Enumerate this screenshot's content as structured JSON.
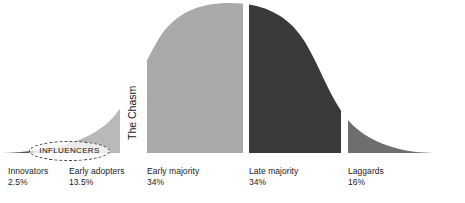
{
  "figure": {
    "type": "diffusion-of-innovation-bell-curve",
    "background_color": "#ffffff",
    "chasm_label": "The Chasm",
    "callout": {
      "label": "INFLUENCERS",
      "shape": "dashed-ellipse",
      "border_color": "#3a3a3a"
    }
  },
  "segments": [
    {
      "key": "innovators",
      "label": "Innovators",
      "percent": "2.5%",
      "color": "#58585a",
      "x_start": 2,
      "x_end": 34
    },
    {
      "key": "early_adopters",
      "label": "Early adopters",
      "percent": "13.5%",
      "color": "#b9b9b9",
      "x_start": 34,
      "x_end": 120
    },
    {
      "key": "early_majority",
      "label": "Early majority",
      "percent": "34%",
      "color": "#a9a9a9",
      "x_start": 147,
      "x_end": 243
    },
    {
      "key": "late_majority",
      "label": "Late majority",
      "percent": "34%",
      "color": "#3a3a3c",
      "x_start": 249,
      "x_end": 341
    },
    {
      "key": "laggards",
      "label": "Laggards",
      "percent": "16%",
      "color": "#6e6e70",
      "x_start": 348,
      "x_end": 437
    }
  ]
}
